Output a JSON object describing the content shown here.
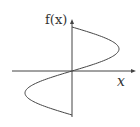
{
  "diagram": {
    "y_axis_label": "f(x)",
    "x_axis_label": "x",
    "curve_description": "sideways sinusoid: horizontal position varies sinusoidally with vertical position",
    "stroke_color": "#444444"
  }
}
